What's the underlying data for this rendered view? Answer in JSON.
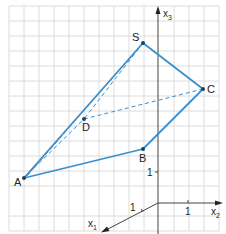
{
  "diagram": {
    "type": "3d-pyramid-coordinate-sketch",
    "colors": {
      "grid": "#d9d9d9",
      "axis": "#444444",
      "edge": "#3b8fc9",
      "point": "#1f3f5c",
      "label": "#222222"
    },
    "axes": {
      "x1": {
        "label": "x",
        "subscript": "1",
        "tick_label": "1"
      },
      "x2": {
        "label": "x",
        "subscript": "2",
        "tick_label": "1"
      },
      "x3": {
        "label": "x",
        "subscript": "3",
        "tick_label": "1"
      }
    },
    "points": [
      {
        "name": "S",
        "label": "S"
      },
      {
        "name": "C",
        "label": "C"
      },
      {
        "name": "B",
        "label": "B"
      },
      {
        "name": "A",
        "label": "A"
      },
      {
        "name": "D",
        "label": "D"
      }
    ],
    "edges_visible": [
      "A-S",
      "S-C",
      "C-B",
      "B-A"
    ],
    "edges_hidden": [
      "A-D",
      "D-C",
      "S-D"
    ]
  }
}
